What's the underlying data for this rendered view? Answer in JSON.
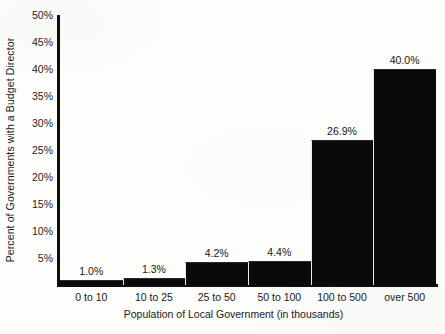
{
  "chart_data": {
    "type": "bar",
    "title": "",
    "subtitle": "",
    "xlabel": "Population of Local Government (in thousands)",
    "ylabel": "Percent of Governments with a Budget Director",
    "categories": [
      "0 to 10",
      "10 to 25",
      "25 to 50",
      "50 to 100",
      "100 to 500",
      "over 500"
    ],
    "values": [
      1.0,
      1.3,
      4.2,
      4.4,
      26.9,
      40.0
    ],
    "value_labels": [
      "1.0%",
      "1.3%",
      "4.2%",
      "4.4%",
      "26.9%",
      "40.0%"
    ],
    "ylim": [
      0,
      50
    ],
    "y_ticks": [
      50,
      45,
      40,
      35,
      30,
      25,
      20,
      15,
      10,
      5
    ],
    "y_tick_labels": [
      "50%",
      "45%",
      "40%",
      "35%",
      "30%",
      "25%",
      "20%",
      "15%",
      "10%",
      "5%"
    ],
    "grid": false,
    "legend": null,
    "bar_color": "#0a0a0a",
    "axis_color": "#0d0d0d",
    "background_color": "#fdfdfb",
    "bar_gap": 0,
    "annotations": []
  }
}
